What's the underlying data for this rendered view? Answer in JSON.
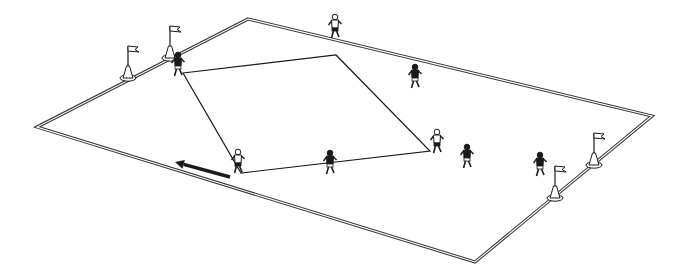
{
  "diagram": {
    "description": "Isometric drill diagram: rectangular pitch with a diamond/square pass pattern, players and corner flags",
    "colors": {
      "background": "#ffffff",
      "line": "#1a1a1a",
      "field_line": "#3a3a3a"
    },
    "field": {
      "corners": {
        "top": [
          248,
          19
        ],
        "right": [
          652,
          116
        ],
        "bottom": [
          475,
          262
        ],
        "left": [
          37,
          127
        ]
      }
    },
    "pass_square": {
      "corners": [
        [
          183,
          73
        ],
        [
          336,
          55
        ],
        [
          430,
          151
        ],
        [
          241,
          173
        ]
      ]
    },
    "movement_arrow": {
      "from": [
        230,
        177
      ],
      "to": [
        175,
        162
      ],
      "direction": "left"
    },
    "flags": [
      {
        "id": "flag-top-left-1",
        "base": [
          128,
          78
        ]
      },
      {
        "id": "flag-top-left-2",
        "base": [
          170,
          58
        ]
      },
      {
        "id": "flag-bottom-right-1",
        "base": [
          555,
          198
        ]
      },
      {
        "id": "flag-bottom-right-2",
        "base": [
          594,
          165
        ]
      }
    ],
    "players": [
      {
        "id": "player-top-left-corner",
        "pos": [
          178,
          68
        ],
        "kit": "dark"
      },
      {
        "id": "player-top-sideline",
        "pos": [
          335,
          30
        ],
        "kit": "light"
      },
      {
        "id": "player-right-top",
        "pos": [
          415,
          80
        ],
        "kit": "dark"
      },
      {
        "id": "player-right-corner",
        "pos": [
          437,
          145
        ],
        "kit": "light"
      },
      {
        "id": "player-mid-right",
        "pos": [
          467,
          160
        ],
        "kit": "dark"
      },
      {
        "id": "player-near-flags",
        "pos": [
          540,
          168
        ],
        "kit": "dark"
      },
      {
        "id": "player-bottom-left-corner",
        "pos": [
          238,
          165
        ],
        "kit": "light"
      },
      {
        "id": "player-bottom-middle",
        "pos": [
          330,
          166
        ],
        "kit": "dark"
      }
    ]
  }
}
